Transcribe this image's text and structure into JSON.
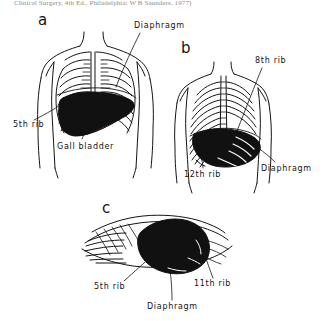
{
  "figure": {
    "caption_source": "Clinical Surgery, 4th Ed., Philadelphia: W B Saunders, 1977)",
    "background_color": "#ffffff",
    "ink_color": "#141414",
    "organ_fill_color": "#111111",
    "panels": [
      {
        "letter": "a",
        "view": "anterior",
        "letter_pos": {
          "x": 38,
          "y": 13
        },
        "labels": [
          {
            "name": "diaphragm",
            "text": "Diaphragm",
            "x": 134,
            "y": 22
          },
          {
            "name": "fifth-rib",
            "text": "5th rib",
            "x": 13,
            "y": 121
          },
          {
            "name": "gall-bladder",
            "text": "Gall bladder",
            "x": 57,
            "y": 143
          }
        ]
      },
      {
        "letter": "b",
        "view": "posterior",
        "letter_pos": {
          "x": 181,
          "y": 41
        },
        "labels": [
          {
            "name": "eighth-rib",
            "text": "8th rib",
            "x": 255,
            "y": 57
          },
          {
            "name": "twelfth-rib",
            "text": "12th rib",
            "x": 184,
            "y": 171
          },
          {
            "name": "diaphragm",
            "text": "Diaphragm",
            "x": 261,
            "y": 165
          }
        ]
      },
      {
        "letter": "c",
        "view": "lateral",
        "letter_pos": {
          "x": 102,
          "y": 201
        },
        "labels": [
          {
            "name": "fifth-rib",
            "text": "5th rib",
            "x": 94,
            "y": 283
          },
          {
            "name": "eleventh-rib",
            "text": "11th rib",
            "x": 194,
            "y": 280
          },
          {
            "name": "diaphragm",
            "text": "Diaphragm",
            "x": 147,
            "y": 303
          }
        ]
      }
    ]
  }
}
